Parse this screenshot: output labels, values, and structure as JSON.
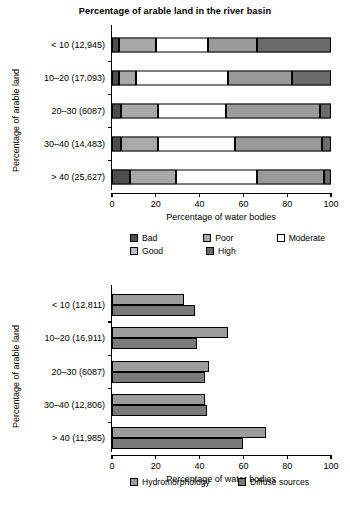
{
  "chart_data": [
    {
      "type": "bar",
      "subtype": "stacked-horizontal",
      "id": "ecological-status-by-arable-land",
      "title": "Percentage of arable land in the river basin",
      "xlabel": "Percentage of water bodies",
      "ylabel": "Percentage of arable land",
      "xlim": [
        0,
        100
      ],
      "xticks": [
        0,
        20,
        40,
        60,
        80,
        100
      ],
      "xticklabels": [
        "0",
        "20",
        "40",
        "60",
        "80",
        "100"
      ],
      "grid": false,
      "legend_position": "bottom",
      "categories": [
        "< 10 (12,945)",
        "10–20 (17,093)",
        "20–30 (6087)",
        "30–40 (14,483)",
        "> 40 (25,627)"
      ],
      "series": [
        {
          "name": "Bad",
          "color": "#4d4d4d",
          "values": [
            3,
            3,
            4,
            4,
            8
          ]
        },
        {
          "name": "Poor",
          "color": "#a8a8a8",
          "values": [
            17,
            8,
            17,
            17,
            21
          ]
        },
        {
          "name": "Moderate",
          "color": "#ffffff",
          "values": [
            24,
            42,
            31,
            35,
            37
          ]
        },
        {
          "name": "Good",
          "color": "#9a9a9a",
          "values": [
            22,
            29,
            43,
            40,
            31
          ]
        },
        {
          "name": "High",
          "color": "#6b6b6b",
          "values": [
            34,
            18,
            5,
            4,
            3
          ]
        }
      ],
      "segment_boundaries": {
        "< 10 (12,945)": [
          0,
          3,
          20,
          44,
          66,
          100
        ],
        "10–20 (17,093)": [
          0,
          3,
          11,
          53,
          82,
          100
        ],
        "20–30 (6087)": [
          0,
          4,
          21,
          52,
          95,
          100
        ],
        "30–40 (14,483)": [
          0,
          4,
          21,
          56,
          96,
          100
        ],
        "> 40 (25,627)": [
          0,
          8,
          29,
          66,
          97,
          100
        ]
      }
    },
    {
      "type": "bar",
      "subtype": "grouped-horizontal",
      "id": "pressures-by-arable-land",
      "title": "",
      "xlabel": "Percentage of water bodies",
      "ylabel": "Percentage of arable land",
      "xlim": [
        0,
        100
      ],
      "xticks": [
        0,
        20,
        40,
        60,
        80,
        100
      ],
      "xticklabels": [
        "0",
        "20",
        "40",
        "60",
        "80",
        "100"
      ],
      "grid": false,
      "legend_position": "bottom",
      "categories": [
        "< 10 (12,811)",
        "10–20 (16,911)",
        "20–30 (6087)",
        "30–40 (12,806)",
        "> 40 (11,985)"
      ],
      "series": [
        {
          "name": "Hydromorphology",
          "color": "#9c9c9c",
          "values": [
            33.0,
            53.0,
            44.5,
            42.5,
            70.5
          ]
        },
        {
          "name": "Diffuse sources",
          "color": "#7a7a7a",
          "values": [
            38.0,
            39.0,
            42.5,
            43.5,
            60.0
          ]
        }
      ]
    }
  ],
  "panel1": {
    "title": "Percentage of arable land in the river basin",
    "ylabel": "Percentage of arable land",
    "xlabel": "Percentage of water bodies",
    "xticklabels": [
      "0",
      "20",
      "40",
      "60",
      "80",
      "100"
    ],
    "categories": [
      "< 10 (12,945)",
      "10–20 (17,093)",
      "20–30 (6087)",
      "30–40 (14,483)",
      "> 40 (25,627)"
    ],
    "legend": [
      {
        "label": "Bad",
        "color": "#4d4d4d"
      },
      {
        "label": "Poor",
        "color": "#a8a8a8"
      },
      {
        "label": "Moderate",
        "color": "#ffffff"
      },
      {
        "label": "Good",
        "color": "#bdbdbd"
      },
      {
        "label": "High",
        "color": "#6b6b6b"
      }
    ]
  },
  "panel2": {
    "ylabel": "Percentage of arable land",
    "xlabel": "Percentage of water bodies",
    "xticklabels": [
      "0",
      "20",
      "40",
      "60",
      "80",
      "100"
    ],
    "categories": [
      "< 10 (12,811)",
      "10–20 (16,911)",
      "20–30 (6087)",
      "30–40 (12,806)",
      "> 40 (11,985)"
    ],
    "legend": [
      {
        "label": "Hydromorphology",
        "color": "#9c9c9c"
      },
      {
        "label": "Diffuse sources",
        "color": "#7a7a7a"
      }
    ]
  }
}
